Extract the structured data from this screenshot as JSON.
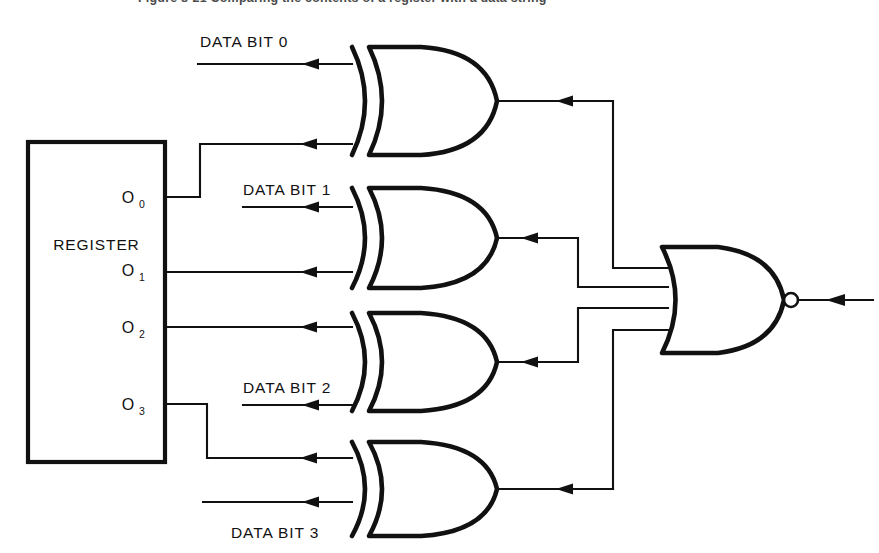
{
  "figure": {
    "caption_partial": "Figure 8-21  Comparing the contents of a register with a data string",
    "title_visible": false
  },
  "diagram": {
    "type": "logic-circuit-schematic",
    "line_color": "#111111",
    "background_color": "#ffffff"
  },
  "register": {
    "label": "REGISTER",
    "x": 28,
    "y": 142,
    "width": 137,
    "height": 320,
    "outputs": [
      {
        "name": "O",
        "subscript": "0",
        "y": 197
      },
      {
        "name": "O",
        "subscript": "1",
        "y": 270
      },
      {
        "name": "O",
        "subscript": "2",
        "y": 327
      },
      {
        "name": "O",
        "subscript": "3",
        "y": 404
      }
    ]
  },
  "data_inputs": [
    {
      "label": "DATA BIT 0",
      "label_x": 200,
      "label_y": 42,
      "wire_y": 64
    },
    {
      "label": "DATA BIT 1",
      "label_x": 243,
      "label_y": 190,
      "wire_y": 207
    },
    {
      "label": "DATA BIT 2",
      "label_x": 243,
      "label_y": 388,
      "wire_y": 405
    },
    {
      "label": "DATA BIT 3",
      "label_x": 231,
      "label_y": 533,
      "wire_y": 502
    }
  ],
  "xor_gates": [
    {
      "id": "xor-0",
      "type": "XOR",
      "x": 352,
      "y": 47,
      "width": 145,
      "height": 108,
      "input_top_y": 64,
      "input_bottom_y": 144,
      "output_y": 101
    },
    {
      "id": "xor-1",
      "type": "XOR",
      "x": 352,
      "y": 188,
      "width": 145,
      "height": 98,
      "input_top_y": 207,
      "input_bottom_y": 273,
      "output_y": 238
    },
    {
      "id": "xor-2",
      "type": "XOR",
      "x": 352,
      "y": 313,
      "width": 145,
      "height": 98,
      "input_top_y": 327,
      "input_bottom_y": 405,
      "output_y": 360
    },
    {
      "id": "xor-3",
      "type": "XOR",
      "x": 352,
      "y": 442,
      "width": 145,
      "height": 98,
      "input_top_y": 458,
      "input_bottom_y": 502,
      "output_y": 489
    }
  ],
  "nor_gate": {
    "id": "nor-out",
    "type": "NOR",
    "x": 662,
    "y": 247,
    "width": 128,
    "height": 106,
    "inputs_y": [
      268,
      287,
      308,
      330
    ],
    "output_y": 300,
    "bubble_x": 791,
    "bubble_r": 7,
    "output_end_x": 873,
    "inverted": true
  },
  "connections": [
    {
      "from": "O0",
      "to": "xor-0.in-bottom",
      "path": "down-step-up"
    },
    {
      "from": "O1",
      "to": "xor-1.in-bottom",
      "path": "straight"
    },
    {
      "from": "O2",
      "to": "xor-2.in-top",
      "path": "straight"
    },
    {
      "from": "O3",
      "to": "xor-3.in-top",
      "path": "down-step"
    },
    {
      "from": "DATA BIT 0",
      "to": "xor-0.in-top",
      "path": "straight"
    },
    {
      "from": "DATA BIT 1",
      "to": "xor-1.in-top",
      "path": "straight"
    },
    {
      "from": "DATA BIT 2",
      "to": "xor-2.in-bottom",
      "path": "straight"
    },
    {
      "from": "DATA BIT 3",
      "to": "xor-3.in-bottom",
      "path": "straight"
    },
    {
      "from": "xor-0.out",
      "to": "nor-out.in-1",
      "path": "right-down"
    },
    {
      "from": "xor-1.out",
      "to": "nor-out.in-2",
      "path": "right-down"
    },
    {
      "from": "xor-2.out",
      "to": "nor-out.in-3",
      "path": "right-up"
    },
    {
      "from": "xor-3.out",
      "to": "nor-out.in-4",
      "path": "right-up"
    }
  ]
}
